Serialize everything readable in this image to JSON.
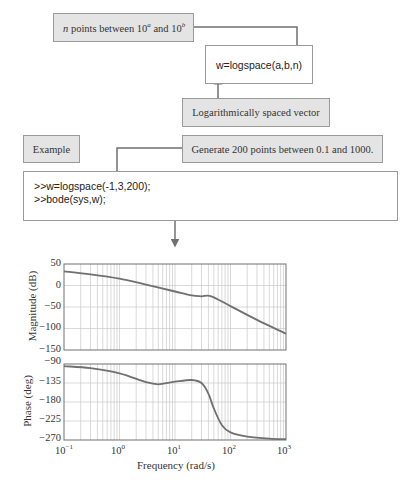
{
  "flow": {
    "input_note": {
      "prefix": "n",
      "text": " points between 10",
      "sup_a": "a",
      "mid": " and 10",
      "sup_b": "b"
    },
    "function_call": "w=logspace(a,b,n)",
    "output_note": "Logarithmically spaced vector",
    "example_label": "Example",
    "example_note": "Generate 200 points between 0.1 and 1000.",
    "code_lines": [
      ">>w=logspace(-1,3,200);",
      ">>bode(sys,w);"
    ]
  },
  "plot": {
    "magnitude_ylabel": "Magnitude (dB)",
    "phase_ylabel": "Phase (deg)",
    "xlabel": "Frequency (rad/s)",
    "x_ticks": [
      {
        "base": "10",
        "exp": "−1"
      },
      {
        "base": "10",
        "exp": "0"
      },
      {
        "base": "10",
        "exp": "1"
      },
      {
        "base": "10",
        "exp": "2"
      },
      {
        "base": "10",
        "exp": "3"
      }
    ],
    "mag_ticks": [
      "50",
      "0",
      "−50",
      "−100",
      "−150"
    ],
    "phase_ticks": [
      "−90",
      "−135",
      "−180",
      "−225",
      "−270"
    ],
    "line_color": "#707070",
    "grid_color": "#c8c8c8"
  },
  "chart_data": [
    {
      "type": "line",
      "title": "Bode magnitude",
      "xlabel": "Frequency (rad/s)",
      "ylabel": "Magnitude (dB)",
      "xscale": "log",
      "xlim": [
        0.1,
        1000
      ],
      "ylim": [
        -150,
        50
      ],
      "yticks": [
        50,
        0,
        -50,
        -100,
        -150
      ],
      "grid": true,
      "x": [
        0.1,
        0.3,
        1,
        3,
        10,
        20,
        30,
        45,
        100,
        300,
        1000
      ],
      "series": [
        {
          "name": "Magnitude",
          "values": [
            33,
            26,
            16,
            2,
            -14,
            -23,
            -25,
            -25,
            -48,
            -80,
            -112
          ]
        }
      ]
    },
    {
      "type": "line",
      "title": "Bode phase",
      "xlabel": "Frequency (rad/s)",
      "ylabel": "Phase (deg)",
      "xscale": "log",
      "xlim": [
        0.1,
        1000
      ],
      "ylim": [
        -270,
        -90
      ],
      "yticks": [
        -90,
        -135,
        -180,
        -225,
        -270
      ],
      "grid": true,
      "x": [
        0.1,
        0.3,
        1,
        3,
        5,
        10,
        20,
        30,
        40,
        50,
        70,
        100,
        200,
        500,
        1000
      ],
      "series": [
        {
          "name": "Phase",
          "values": [
            -95,
            -100,
            -112,
            -133,
            -138,
            -132,
            -128,
            -135,
            -160,
            -195,
            -235,
            -252,
            -262,
            -267,
            -268
          ]
        }
      ]
    }
  ]
}
